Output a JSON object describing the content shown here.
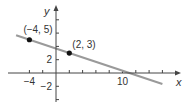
{
  "chart_data": {
    "type": "line",
    "title": "",
    "xlabel": "x",
    "ylabel": "y",
    "xlim": [
      -6,
      16
    ],
    "ylim": [
      -4,
      9
    ],
    "x_tick_step": 2,
    "y_tick_step": 2,
    "x_tick_labels": [
      {
        "value": -4,
        "label": "−4"
      },
      {
        "value": 10,
        "label": "10"
      }
    ],
    "y_tick_labels": [
      {
        "value": 2,
        "label": "2"
      },
      {
        "value": -2,
        "label": "−2"
      }
    ],
    "grid": false,
    "line": {
      "slope": -0.3333,
      "intercept": 3.6667,
      "from_x": -6,
      "to_x": 16,
      "color": "#999999"
    },
    "points": [
      {
        "x": -4,
        "y": 5,
        "label": "(−4, 5)"
      },
      {
        "x": 2,
        "y": 3,
        "label": "(2, 3)"
      }
    ]
  },
  "colors": {
    "axis": "#444444",
    "line": "#9a9a9a",
    "point": "#111111",
    "text": "#333333"
  }
}
